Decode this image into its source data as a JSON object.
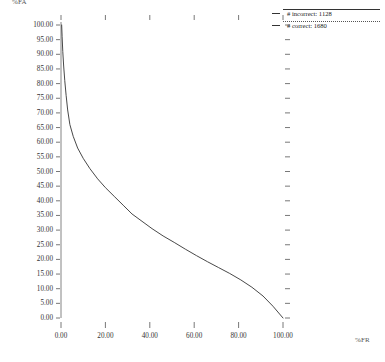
{
  "chart_data": {
    "type": "line",
    "title": "",
    "xlabel": "%FR",
    "ylabel": "%FA",
    "xlim": [
      0,
      100
    ],
    "ylim": [
      0,
      100
    ],
    "grid": false,
    "legend_position": "top-right",
    "xticks": [
      "0.00",
      "20.00",
      "40.00",
      "60.00",
      "80.00",
      "100.00"
    ],
    "xtick_values": [
      0,
      20,
      40,
      60,
      80,
      100
    ],
    "yticks": [
      "0.00",
      "5.00",
      "10.00",
      "15.00",
      "20.00",
      "25.00",
      "30.00",
      "35.00",
      "40.00",
      "45.00",
      "50.00",
      "55.00",
      "60.00",
      "65.00",
      "70.00",
      "75.00",
      "80.00",
      "85.00",
      "90.00",
      "95.00",
      "100.00"
    ],
    "ytick_values": [
      0,
      5,
      10,
      15,
      20,
      25,
      30,
      35,
      40,
      45,
      50,
      55,
      60,
      65,
      70,
      75,
      80,
      85,
      90,
      95,
      100
    ],
    "series": [
      {
        "name": "# incorrect: 1128",
        "style": "solid",
        "color": "#333333",
        "x": [
          0.3,
          0.5,
          0.8,
          1.2,
          1.7,
          2.3,
          3.0,
          4.0,
          5.5,
          7.5,
          10.0,
          13.0,
          16.5,
          20.0,
          24.0,
          28.0,
          32.0,
          36.5,
          41.0,
          46.0,
          51.0,
          56.0,
          61.0,
          66.0,
          71.0,
          76.0,
          81.0,
          86.0,
          91.0,
          95.5,
          100.0
        ],
        "y": [
          100.0,
          96.0,
          91.0,
          86.0,
          81.0,
          76.0,
          71.0,
          66.0,
          62.0,
          58.0,
          54.5,
          51.0,
          47.5,
          44.5,
          41.5,
          38.5,
          35.5,
          33.0,
          30.5,
          28.0,
          25.8,
          23.5,
          21.3,
          19.2,
          17.2,
          15.2,
          13.0,
          10.5,
          7.5,
          4.0,
          0.0
        ]
      }
    ]
  },
  "legend": {
    "entries": [
      {
        "label": "# incorrect: 1128",
        "style": "solid"
      },
      {
        "label": "# correct: 1680",
        "style": "dotted"
      }
    ]
  },
  "axes": {
    "y_title": "%FA",
    "x_title": "%FR"
  }
}
